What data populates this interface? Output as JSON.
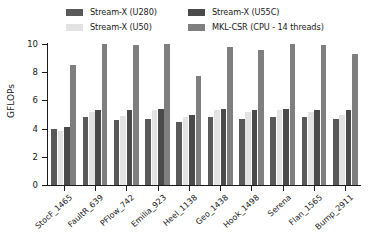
{
  "chart_data": {
    "type": "bar",
    "title": "",
    "xlabel": "",
    "ylabel": "GFLOPs",
    "ylim": [
      0,
      10
    ],
    "yticks": [
      0,
      2,
      4,
      6,
      8,
      10
    ],
    "grid": false,
    "legend_position": "top",
    "categories": [
      "StocF_1465",
      "FaultR_639",
      "PFlow_742",
      "Emilia_923",
      "Heel_1138",
      "Geo_1438",
      "Hook_1498",
      "Serena",
      "Flan_1565",
      "Bump_2911"
    ],
    "series": [
      {
        "name": "Stream-X (U280)",
        "color": "#595959",
        "values": [
          4.0,
          4.8,
          4.6,
          4.7,
          4.5,
          4.8,
          4.7,
          4.8,
          4.8,
          4.7
        ]
      },
      {
        "name": "Stream-X (U50)",
        "color": "#e3e3e3",
        "values": [
          3.8,
          5.2,
          4.9,
          5.3,
          4.8,
          5.3,
          5.2,
          5.3,
          5.2,
          5.0
        ]
      },
      {
        "name": "Stream-X (U55C)",
        "color": "#4a4a4a",
        "values": [
          4.1,
          5.3,
          5.3,
          5.4,
          5.0,
          5.4,
          5.3,
          5.4,
          5.3,
          5.3
        ]
      },
      {
        "name": "MKL-CSR (CPU - 14 threads)",
        "color": "#7f7f7f",
        "values": [
          8.5,
          10.0,
          9.9,
          10.0,
          7.7,
          9.8,
          9.6,
          10.0,
          9.9,
          9.3
        ]
      }
    ]
  },
  "legend": {
    "entries": [
      {
        "label": "Stream-X (U280)",
        "color": "#595959"
      },
      {
        "label": "Stream-X (U50)",
        "color": "#e3e3e3"
      },
      {
        "label": "Stream-X (U55C)",
        "color": "#4a4a4a"
      },
      {
        "label": "MKL-CSR (CPU - 14 threads)",
        "color": "#7f7f7f"
      }
    ]
  },
  "axes": {
    "y_axis_label": "GFLOPs",
    "y_tick_labels": [
      "0",
      "2",
      "4",
      "6",
      "8",
      "10"
    ]
  }
}
